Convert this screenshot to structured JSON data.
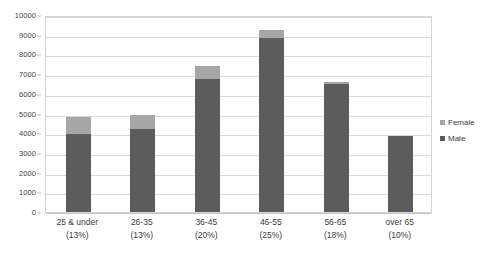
{
  "chart_data": {
    "type": "bar",
    "subtype": "stacked",
    "title": "",
    "xlabel": "",
    "ylabel": "",
    "ylim": [
      0,
      10000
    ],
    "ytick_step": 1000,
    "yticks": [
      0,
      1000,
      2000,
      3000,
      4000,
      5000,
      6000,
      7000,
      8000,
      9000,
      10000
    ],
    "ytick_labels": [
      "0",
      "1000",
      "2000",
      "3000",
      "4000",
      "5000",
      "6000",
      "7000",
      "8000",
      "9000",
      "10000"
    ],
    "grid": true,
    "grid_axis": "y",
    "legend_position": "right",
    "categories": [
      "25 & under",
      "26-35",
      "36-45",
      "46-55",
      "56-65",
      "over 65"
    ],
    "category_percents": [
      "(13%)",
      "(13%)",
      "(20%)",
      "(25%)",
      "(18%)",
      "(10%)"
    ],
    "series": [
      {
        "name": "Male",
        "color": "#5c5c5c",
        "values": [
          3950,
          4200,
          6750,
          8850,
          6500,
          3850
        ]
      },
      {
        "name": "Female",
        "color": "#a6a6a6",
        "values": [
          850,
          700,
          650,
          400,
          100,
          0
        ]
      }
    ],
    "totals": [
      4800,
      4900,
      7400,
      9250,
      6600,
      3850
    ],
    "colors": {
      "male": "#5c5c5c",
      "female": "#a6a6a6",
      "gridline": "#d9d9d9",
      "plot_border": "#d3d3d3",
      "text": "#3a3a3a",
      "background": "#ffffff"
    }
  },
  "legend": {
    "items": [
      {
        "label": "Female",
        "color": "#a6a6a6"
      },
      {
        "label": "Male",
        "color": "#5c5c5c"
      }
    ]
  }
}
